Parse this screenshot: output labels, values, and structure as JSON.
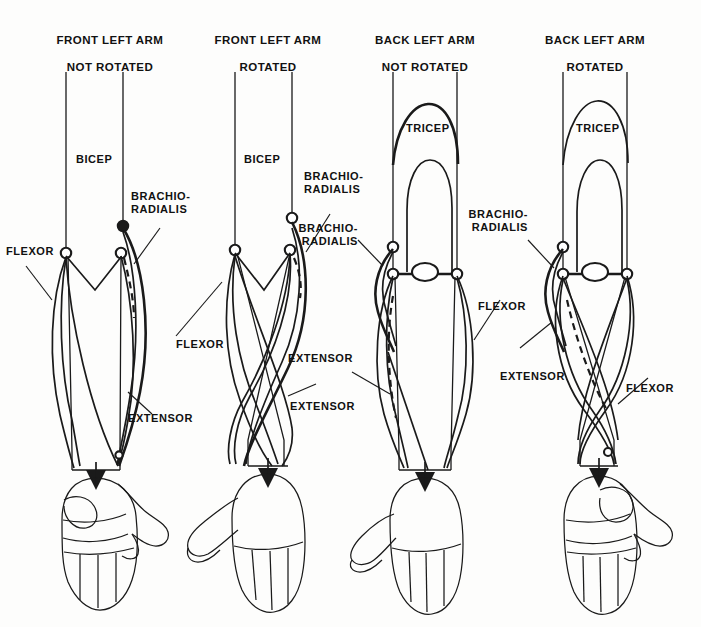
{
  "document": {
    "type": "anatomical-diagram",
    "subject": "Human arm muscle structure, front and back views, rotated and not rotated",
    "background_color": "#fdfdfc",
    "ink_color": "#1a1a1a"
  },
  "panels": [
    {
      "id": "front-not-rotated",
      "title": "FRONT LEFT ARM\nNOT ROTATED",
      "title_line1": "FRONT LEFT ARM",
      "title_line2": "NOT ROTATED",
      "view": "front",
      "rotated": false,
      "labels": [
        {
          "name": "bicep",
          "text": "BICEP"
        },
        {
          "name": "brachio-radialis",
          "text": "BRACHIO-\nRADIALIS"
        },
        {
          "name": "flexor",
          "text": "FLEXOR"
        },
        {
          "name": "extensor",
          "text": "EXTENSOR"
        }
      ]
    },
    {
      "id": "front-rotated",
      "title": "FRONT LEFT ARM\nROTATED",
      "title_line1": "FRONT LEFT ARM",
      "title_line2": "ROTATED",
      "view": "front",
      "rotated": true,
      "labels": [
        {
          "name": "bicep",
          "text": "BICEP"
        },
        {
          "name": "brachio-radialis",
          "text": "BRACHIO-\nRADIALIS"
        },
        {
          "name": "flexor",
          "text": "FLEXOR"
        },
        {
          "name": "extensor",
          "text": "EXTENSOR"
        }
      ]
    },
    {
      "id": "back-not-rotated",
      "title": "BACK LEFT ARM\nNOT ROTATED",
      "title_line1": "BACK LEFT ARM",
      "title_line2": "NOT ROTATED",
      "view": "back",
      "rotated": false,
      "labels": [
        {
          "name": "tricep",
          "text": "TRICEP"
        },
        {
          "name": "brachio-radialis",
          "text": "BRACHIO-\nRADIALIS"
        },
        {
          "name": "flexor",
          "text": "FLEXOR"
        },
        {
          "name": "extensor",
          "text": "EXTENSOR"
        }
      ]
    },
    {
      "id": "back-rotated",
      "title": "BACK LEFT ARM\nROTATED",
      "title_line1": "BACK LEFT ARM",
      "title_line2": "ROTATED",
      "view": "back",
      "rotated": true,
      "labels": [
        {
          "name": "tricep",
          "text": "TRICEP"
        },
        {
          "name": "brachio-radialis",
          "text": "BRACHIO-\nRADIALIS"
        },
        {
          "name": "flexor",
          "text": "FLEXOR"
        },
        {
          "name": "extensor",
          "text": "EXTENSOR"
        }
      ]
    }
  ],
  "titles": {
    "p1_l1": "FRONT LEFT ARM",
    "p1_l2": "NOT ROTATED",
    "p2_l1": "FRONT LEFT ARM",
    "p2_l2": "ROTATED",
    "p3_l1": "BACK LEFT ARM",
    "p3_l2": "NOT ROTATED",
    "p4_l1": "BACK LEFT ARM",
    "p4_l2": "ROTATED"
  },
  "labels": {
    "p1_bicep": "BICEP",
    "p1_brachio": "BRACHIO-\nRADIALIS",
    "p1_flexor": "FLEXOR",
    "p1_extensor": "EXTENSOR",
    "p2_bicep": "BICEP",
    "p2_brachio": "BRACHIO-\nRADIALIS",
    "p2_flexor": "FLEXOR",
    "p2_extensor": "EXTENSOR",
    "p3_tricep": "TRICEP",
    "p3_brachio": "BRACHIO-\nRADIALIS",
    "p3_flexor": "FLEXOR",
    "p3_extensor": "EXTENSOR",
    "p4_tricep": "TRICEP",
    "p4_brachio": "BRACHIO-\nRADIALIS",
    "p4_flexor": "FLEXOR",
    "p4_extensor": "EXTENSOR"
  }
}
